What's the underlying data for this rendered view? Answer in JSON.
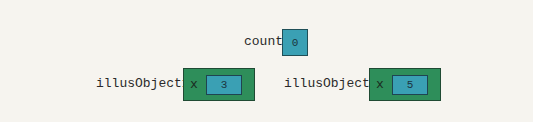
{
  "colors": {
    "background": "#f6f4ef",
    "value_box": "#3aa0b4",
    "object_box": "#2e8e5a"
  },
  "static_var": {
    "name": "count",
    "value": "0"
  },
  "objects": [
    {
      "name": "illusObject1",
      "field": "x",
      "value": "3"
    },
    {
      "name": "illusObject2",
      "field": "x",
      "value": "5"
    }
  ]
}
